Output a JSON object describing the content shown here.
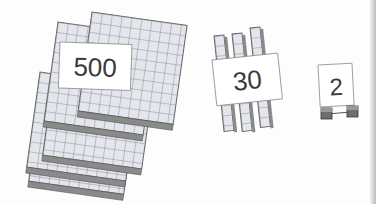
{
  "illustration": {
    "title": "Base-ten blocks showing 532",
    "groups": [
      {
        "label": "500",
        "block_type": "hundreds-flat",
        "count": 5
      },
      {
        "label": "30",
        "block_type": "tens-rod",
        "count": 3
      },
      {
        "label": "2",
        "block_type": "unit-cube",
        "count": 2
      }
    ]
  },
  "colors": {
    "block_face": "#e3e6ec",
    "block_edge": "#6f6f6f",
    "block_side": "#8a8a8a",
    "card_bg": "#ffffff",
    "card_text": "#3a3a3a"
  }
}
